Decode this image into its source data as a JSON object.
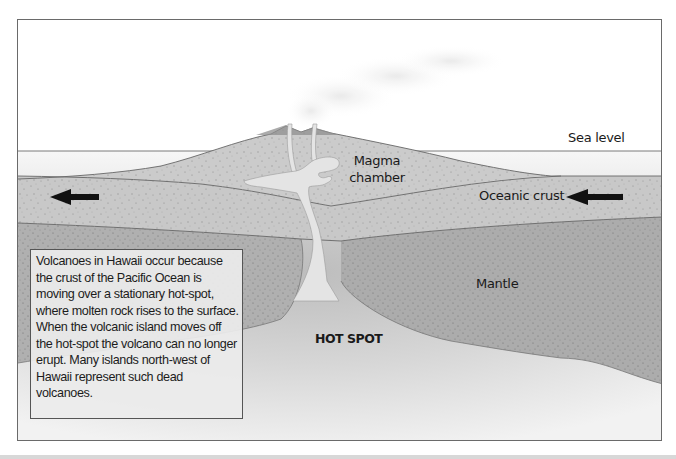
{
  "diagram": {
    "labels": {
      "sea_level": "Sea level",
      "magma_chamber": "Magma chamber",
      "oceanic_crust": "Oceanic crust",
      "mantle": "Mantle",
      "hot_spot": "HOT SPOT"
    },
    "caption": "Volcanoes in Hawaii occur because the crust of the Pacific Ocean is moving over a stationary hot-spot, where molten rock rises to the surface. When the volcanic island moves off the hot-spot the volcano can no longer erupt. Many islands north-west of Hawaii represent such dead volcanoes.",
    "arrows": [
      {
        "name": "plate-motion-arrow-left",
        "direction": "left"
      },
      {
        "name": "plate-motion-arrow-right",
        "direction": "left"
      }
    ],
    "colors": {
      "frame_border": "#6a6a6a",
      "crust": "#c9c9c9",
      "mantle": "#ababab",
      "hot_spot": "#d6d6d6",
      "magma": "#e6e6e6",
      "sea": "#eeeeee",
      "arrow": "#111111"
    }
  }
}
